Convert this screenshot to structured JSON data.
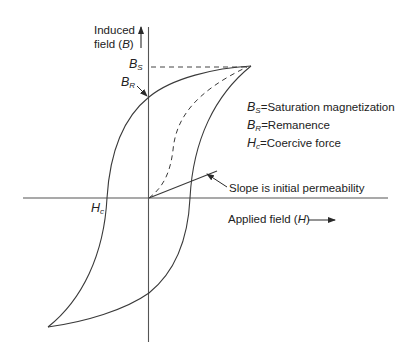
{
  "diagram": {
    "type": "B-H hysteresis loop",
    "vertical_axis": {
      "label_line1": "Induced",
      "label_line2_prefix": "field (",
      "label_symbol": "B",
      "label_line2_suffix": ")"
    },
    "horizontal_axis": {
      "label_prefix": "Applied field (",
      "label_symbol": "H",
      "label_suffix": ")"
    },
    "markers": {
      "bs": {
        "base": "B",
        "sub": "S"
      },
      "br": {
        "base": "B",
        "sub": "R"
      },
      "hc": {
        "base": "H",
        "sub": "c"
      }
    },
    "legend": [
      {
        "base": "B",
        "sub": "S",
        "text": "=Saturation magnetization"
      },
      {
        "base": "B",
        "sub": "R",
        "text": "=Remanence"
      },
      {
        "base": "H",
        "sub": "c",
        "text": "=Coercive force"
      }
    ],
    "annotation": "Slope is initial permeability",
    "colors": {
      "line": "#3a3a3a",
      "text": "#222222",
      "background": "#ffffff"
    }
  }
}
